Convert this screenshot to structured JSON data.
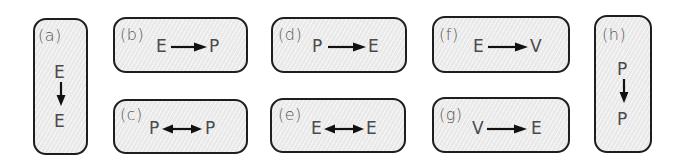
{
  "diagram": {
    "colors": {
      "box_fill": "#e9e9e9",
      "box_border": "#1e1e1e",
      "text": "#4a4a4a",
      "arrow": "#111111"
    },
    "panels": [
      {
        "id": "a",
        "label": "(a)",
        "from": "E",
        "to": "E",
        "arrow": "down",
        "orientation": "vertical"
      },
      {
        "id": "b",
        "label": "(b)",
        "from": "E",
        "to": "P",
        "arrow": "right",
        "orientation": "horizontal"
      },
      {
        "id": "c",
        "label": "(c)",
        "from": "P",
        "to": "P",
        "arrow": "both",
        "orientation": "horizontal"
      },
      {
        "id": "d",
        "label": "(d)",
        "from": "P",
        "to": "E",
        "arrow": "right",
        "orientation": "horizontal"
      },
      {
        "id": "e",
        "label": "(e)",
        "from": "E",
        "to": "E",
        "arrow": "both",
        "orientation": "horizontal"
      },
      {
        "id": "f",
        "label": "(f)",
        "from": "E",
        "to": "V",
        "arrow": "right",
        "orientation": "horizontal"
      },
      {
        "id": "g",
        "label": "(g)",
        "from": "V",
        "to": "E",
        "arrow": "right",
        "orientation": "horizontal"
      },
      {
        "id": "h",
        "label": "(h)",
        "from": "P",
        "to": "P",
        "arrow": "down",
        "orientation": "vertical"
      }
    ]
  }
}
